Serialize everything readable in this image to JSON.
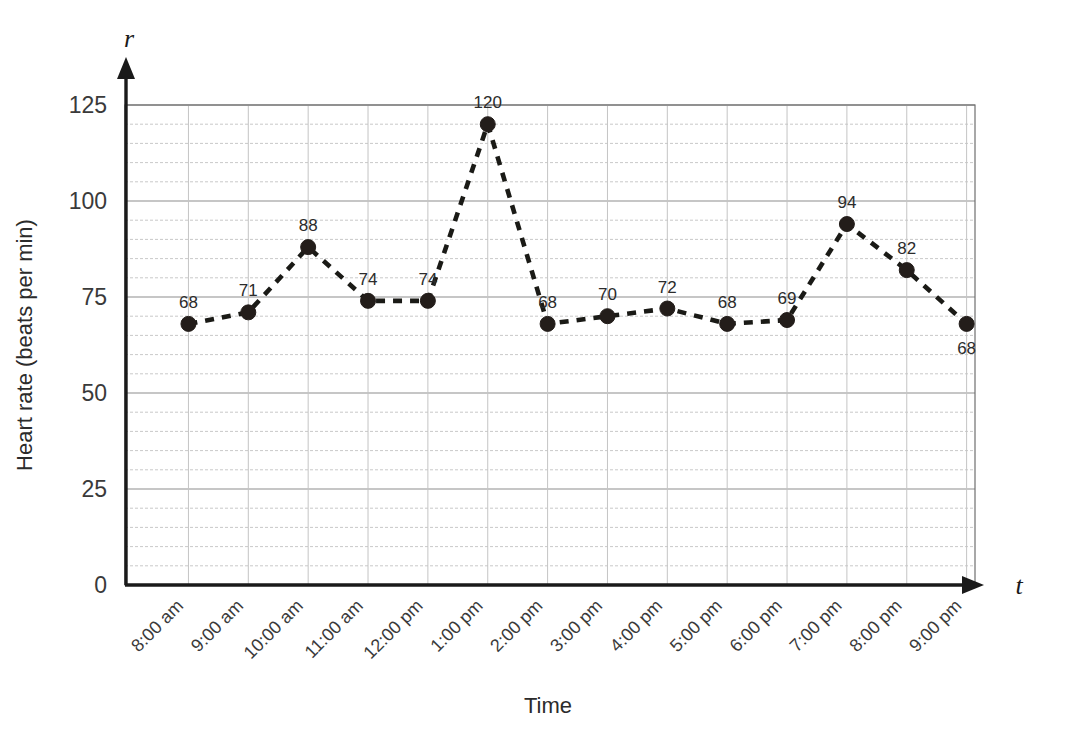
{
  "chart_data": {
    "type": "line",
    "title": "",
    "xlabel": "Time",
    "ylabel": "Heart rate (beats per min)",
    "x_axis_variable": "t",
    "y_axis_variable": "r",
    "categories": [
      "8:00 am",
      "9:00 am",
      "10:00 am",
      "11:00 am",
      "12:00 pm",
      "1:00 pm",
      "2:00 pm",
      "3:00 pm",
      "4:00 pm",
      "5:00 pm",
      "6:00 pm",
      "7:00 pm",
      "8:00 pm",
      "9:00 pm"
    ],
    "values": [
      68,
      71,
      88,
      74,
      74,
      120,
      68,
      70,
      72,
      68,
      69,
      94,
      82,
      68
    ],
    "point_labels": [
      "68",
      "71",
      "88",
      "74",
      "74",
      "120",
      "68",
      "70",
      "72",
      "68",
      "69",
      "94",
      "82",
      "68"
    ],
    "ylim": [
      0,
      125
    ],
    "y_ticks": [
      0,
      25,
      50,
      75,
      100,
      125
    ],
    "y_tick_labels": [
      "0",
      "25",
      "50",
      "75",
      "100",
      "125"
    ],
    "y_minor_step": 5,
    "grid": true,
    "legend": null,
    "line_style": "dashed",
    "marker": "circle",
    "series_color": "#231d1a",
    "grid_color": "#c9c9c9",
    "label_below_indices": [
      13
    ]
  }
}
